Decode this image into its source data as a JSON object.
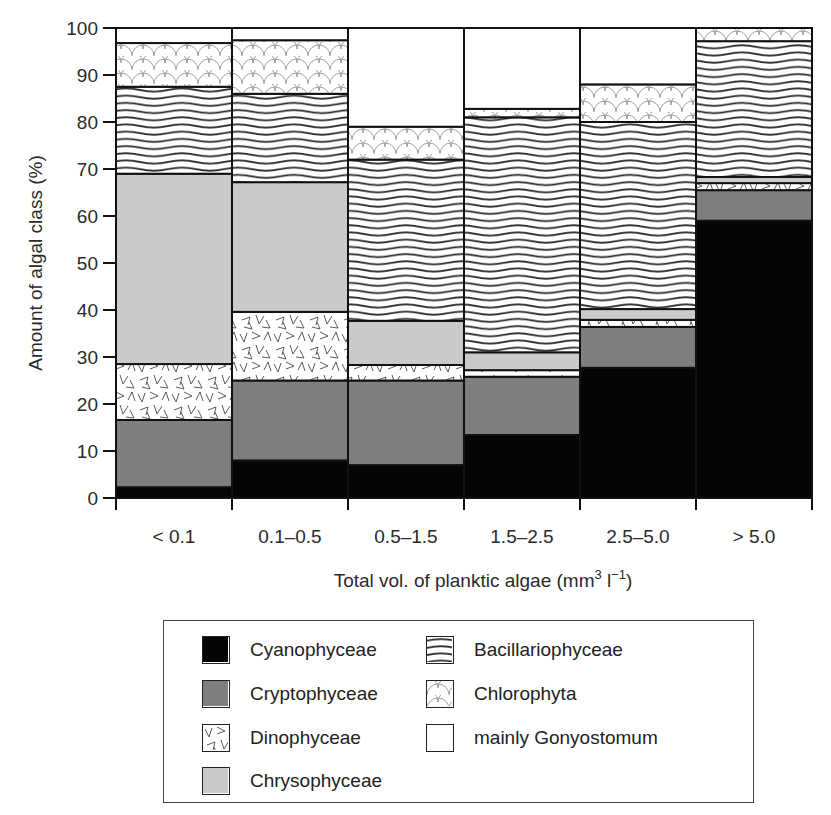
{
  "chart_data": {
    "type": "bar",
    "stacked": true,
    "title": "",
    "xlabel": "Total vol. of planktic algae (mm3 l-1)",
    "xlabel_parts": {
      "main": "Total vol. of planktic algae (mm",
      "sup1": "3",
      "mid": " l",
      "sup2": "−1",
      "end": ")"
    },
    "ylabel": "Amount of algal class (%)",
    "ylim": [
      0,
      100
    ],
    "yticks": [
      0,
      10,
      20,
      30,
      40,
      50,
      60,
      70,
      80,
      90,
      100
    ],
    "grid": false,
    "legend_position": "below",
    "categories": [
      "< 0.1",
      "0.1–0.5",
      "0.5–1.5",
      "1.5–2.5",
      "2.5–5.0",
      "> 5.0"
    ],
    "series": [
      {
        "name": "Cyanophyceae",
        "pattern": "solid-black",
        "color": "#050505",
        "values": [
          2.3,
          8.0,
          7.0,
          13.4,
          27.7,
          59.0
        ]
      },
      {
        "name": "Cryptophyceae",
        "pattern": "solid-darkgray",
        "color": "#7d7d7d",
        "values": [
          14.3,
          17.0,
          18.0,
          12.4,
          8.7,
          6.5
        ]
      },
      {
        "name": "Dinophyceae",
        "pattern": "v-marks",
        "color": "#ffffff",
        "values": [
          11.9,
          14.6,
          3.3,
          1.4,
          1.5,
          1.5
        ]
      },
      {
        "name": "Chrysophyceae",
        "pattern": "solid-lightgray",
        "color": "#c8c8c8",
        "values": [
          40.5,
          27.6,
          9.4,
          3.8,
          2.3,
          1.3
        ]
      },
      {
        "name": "Bacillariophyceae",
        "pattern": "wavy-lines",
        "color": "#ffffff",
        "values": [
          18.5,
          18.8,
          34.3,
          50.0,
          39.8,
          28.9
        ]
      },
      {
        "name": "Chlorophyta",
        "pattern": "scallops",
        "color": "#ffffff",
        "values": [
          9.3,
          11.4,
          7.0,
          1.8,
          8.0,
          2.8
        ]
      },
      {
        "name": "mainly Gonyostomum",
        "pattern": "blank",
        "color": "#ffffff",
        "values": [
          3.2,
          2.6,
          21.0,
          17.2,
          12.0,
          0.0
        ]
      }
    ]
  },
  "legend": {
    "items": [
      {
        "label": "Cyanophyceae",
        "pattern": "solid-black"
      },
      {
        "label": "Cryptophyceae",
        "pattern": "solid-darkgray"
      },
      {
        "label": "Dinophyceae",
        "pattern": "v-marks"
      },
      {
        "label": "Chrysophyceae",
        "pattern": "solid-lightgray"
      },
      {
        "label": "Bacillariophyceae",
        "pattern": "wavy-lines"
      },
      {
        "label": "Chlorophyta",
        "pattern": "scallops"
      },
      {
        "label": "mainly Gonyostomum",
        "pattern": "blank"
      }
    ]
  }
}
